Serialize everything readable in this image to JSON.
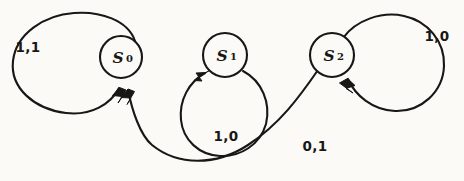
{
  "diagram": {
    "type": "state-transition-diagram",
    "style": "hand-drawn-sketch",
    "background_color": "#fbfaf7",
    "ink_color": "#191716",
    "states": [
      {
        "id": "s0",
        "label": "S",
        "subscript": "0",
        "full_label": "S0",
        "cx": 121,
        "cy": 57,
        "r": 21
      },
      {
        "id": "s1",
        "label": "S",
        "subscript": "1",
        "full_label": "S1",
        "cx": 225,
        "cy": 55,
        "r": 22
      },
      {
        "id": "s2",
        "label": "S",
        "subscript": "2",
        "full_label": "S2",
        "cx": 332,
        "cy": 55,
        "r": 22
      }
    ],
    "transitions": [
      {
        "id": "t-s0-self",
        "from": "s0",
        "to": "s0",
        "kind": "self-loop",
        "label": "1,1",
        "label_x": 28,
        "label_y": 47
      },
      {
        "id": "t-s1-self",
        "from": "s1",
        "to": "s1",
        "kind": "self-loop",
        "label": "1,0",
        "label_x": 226,
        "label_y": 136
      },
      {
        "id": "t-s2-self",
        "from": "s2",
        "to": "s2",
        "kind": "self-loop",
        "label": "1,0",
        "label_x": 437,
        "label_y": 36
      },
      {
        "id": "t-s2-s0",
        "from": "s2",
        "to": "s0",
        "kind": "arc",
        "label": "0,1",
        "label_x": 315,
        "label_y": 146
      }
    ]
  }
}
